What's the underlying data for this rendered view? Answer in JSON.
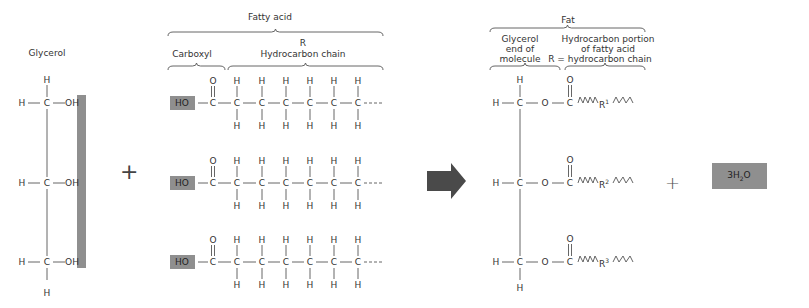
{
  "labels": {
    "glycerol": "Glycerol",
    "fatty_acid": "Fatty acid",
    "carboxyl": "Carboxyl",
    "r": "R",
    "hydrocarbon_chain": "Hydrocarbon chain",
    "fat": "Fat",
    "glycerol_end_1": "Glycerol",
    "glycerol_end_2": "end of",
    "glycerol_end_3": "molecule",
    "hc_portion_1": "Hydrocarbon portion",
    "hc_portion_2": "of fatty acid",
    "hc_portion_3": "R = hydrocarbon chain"
  },
  "operators": {
    "plus": "+",
    "products_plus": "+"
  },
  "glycerol": {
    "rows": [
      {
        "left": "H",
        "center": "C",
        "right": "OH"
      },
      {
        "left": "H",
        "center": "C",
        "right": "OH"
      },
      {
        "left": "H",
        "center": "C",
        "right": "OH"
      }
    ],
    "top_h": "H",
    "bottom_h": "H"
  },
  "fatty_acids": {
    "ho_label": "HO",
    "carbonyl_o": "O",
    "carbonyl_c": "C",
    "chain_atom": "C",
    "chain_h": "H",
    "rows": 3,
    "chain_length": 6
  },
  "fat": {
    "atoms": {
      "h": "H",
      "c": "C",
      "o": "O"
    },
    "r_labels": [
      "R",
      "R",
      "R"
    ],
    "r_sup": [
      "1",
      "2",
      "3"
    ]
  },
  "water": {
    "label_main": "3H",
    "label_sub": "2",
    "label_end": "O"
  },
  "colors": {
    "highlight_gray": "#8f8f8f",
    "arrow": "#4a4a4a",
    "line": "#555555"
  }
}
